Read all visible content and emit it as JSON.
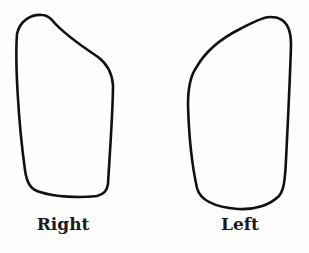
{
  "figure": {
    "shapes": [
      {
        "name": "right-outline",
        "label": "Right"
      },
      {
        "name": "left-outline",
        "label": "Left"
      }
    ],
    "stroke_color": "#111111",
    "background": "#fefefe"
  }
}
